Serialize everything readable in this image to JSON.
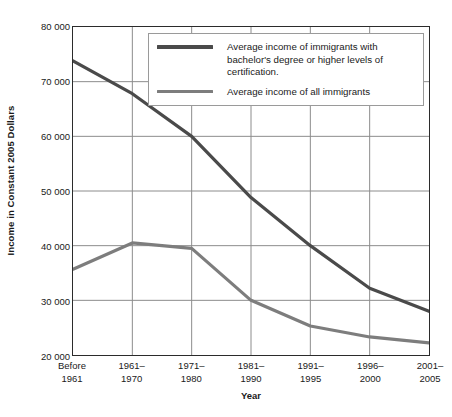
{
  "chart_data": {
    "type": "line",
    "title": "",
    "xlabel": "Year",
    "ylabel": "Income in Constant 2005 Dollars",
    "categories": [
      "Before\n1961",
      "1961–\n1970",
      "1971–\n1980",
      "1981–\n1990",
      "1991–\n1995",
      "1996–\n2000",
      "2001–\n2005"
    ],
    "ylim": [
      20000,
      80000
    ],
    "yticks": [
      20000,
      30000,
      40000,
      50000,
      60000,
      70000,
      80000
    ],
    "ytick_labels": [
      "20 000",
      "30 000",
      "40 000",
      "50 000",
      "60 000",
      "70 000",
      "80 000"
    ],
    "grid": true,
    "legend_position": "top-center",
    "series": [
      {
        "name": "Average income of immigrants with bachelor's degree or higher levels of certification.",
        "color": "#4a4a4a",
        "values": [
          73800,
          67800,
          60000,
          48800,
          40000,
          32200,
          28000
        ]
      },
      {
        "name": "Average income of all immigrants",
        "color": "#7d7d7d",
        "values": [
          35700,
          40500,
          39500,
          30000,
          25300,
          23300,
          22200
        ]
      }
    ]
  },
  "axes": {
    "y_title": "Income in Constant 2005 Dollars",
    "x_title": "Year",
    "y_labels": [
      "80 000",
      "70 000",
      "60 000",
      "50 000",
      "40 000",
      "30 000",
      "20 000"
    ],
    "x_labels": [
      {
        "line1": "Before",
        "line2": "1961"
      },
      {
        "line1": "1961–",
        "line2": "1970"
      },
      {
        "line1": "1971–",
        "line2": "1980"
      },
      {
        "line1": "1981–",
        "line2": "1990"
      },
      {
        "line1": "1991–",
        "line2": "1995"
      },
      {
        "line1": "1996–",
        "line2": "2000"
      },
      {
        "line1": "2001–",
        "line2": "2005"
      }
    ]
  },
  "legend": {
    "entries": [
      {
        "label_line1": "Average income of immigrants with bachelor's",
        "label_line2": "degree or higher levels of certification.",
        "color": "#4a4a4a"
      },
      {
        "label_line1": "Average income of all immigrants",
        "label_line2": "",
        "color": "#7d7d7d"
      }
    ]
  },
  "colors": {
    "series_dark": "#4a4a4a",
    "series_light": "#7d7d7d",
    "grid": "#8c8c8c",
    "axis": "#2b2b2b",
    "text": "#1a1a1a",
    "legend_border": "#9a9a9a",
    "background": "#ffffff"
  }
}
